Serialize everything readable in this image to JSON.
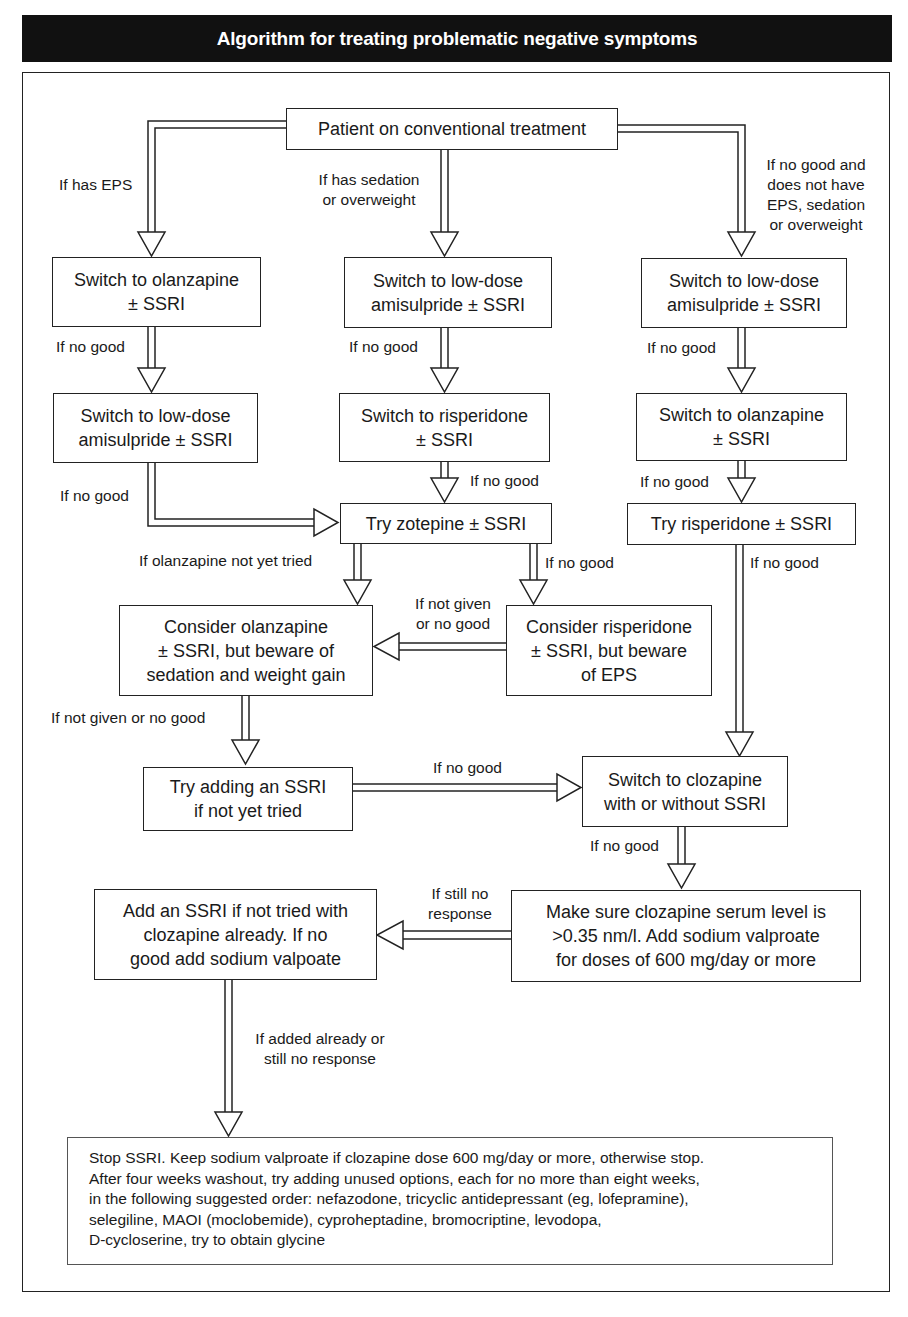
{
  "title": "Algorithm for treating problematic negative symptoms",
  "boxes": {
    "start": "Patient on conventional treatment",
    "left1_line1": "Switch to olanzapine",
    "left1_line2": "± SSRI",
    "left2_line1": "Switch to low-dose",
    "left2_line2": "amisulpride ± SSRI",
    "mid1_line1": "Switch to low-dose",
    "mid1_line2": "amisulpride ± SSRI",
    "mid2_line1": "Switch to risperidone",
    "mid2_line2": "± SSRI",
    "right1_line1": "Switch to low-dose",
    "right1_line2": "amisulpride ± SSRI",
    "right2_line1": "Switch to olanzapine",
    "right2_line2": "± SSRI",
    "right3": "Try risperidone ± SSRI",
    "zotepine": "Try zotepine ± SSRI",
    "consider_olanzapine_line1": "Consider olanzapine",
    "consider_olanzapine_line2": "± SSRI, but  beware of",
    "consider_olanzapine_line3": "sedation and weight gain",
    "consider_risperidone_line1": "Consider risperidone",
    "consider_risperidone_line2": "± SSRI, but beware",
    "consider_risperidone_line3": "of EPS",
    "add_ssri_line1": "Try adding an SSRI",
    "add_ssri_line2": "if not yet tried",
    "clozapine_line1": "Switch to clozapine",
    "clozapine_line2": "with or without SSRI",
    "serum_line1": "Make sure clozapine serum level is",
    "serum_line2": ">0.35 nm/l. Add sodium valproate",
    "serum_line3": "for doses of 600 mg/day or more",
    "add_ssri_cloz_line1": "Add an SSRI if not tried with",
    "add_ssri_cloz_line2": "clozapine already. If no",
    "add_ssri_cloz_line3": "good add sodium valpoate",
    "final_lines": [
      "Stop SSRI. Keep sodium valproate if clozapine dose 600 mg/day or more, otherwise stop.",
      "After four weeks washout, try adding unused options, each for no more than eight weeks,",
      "in the following suggested order: nefazodone, tricyclic antidepressant (eg, lofepramine),",
      "selegiline, MAOI (moclobemide), cyproheptadine, bromocriptine, levodopa,",
      "D-cycloserine, try to obtain glycine"
    ]
  },
  "labels": {
    "has_eps": "If has EPS",
    "sedation_1": "If has sedation",
    "sedation_2": "or overweight",
    "no_eps_1": "If no good and",
    "no_eps_2": "does not have",
    "no_eps_3": "EPS, sedation",
    "no_eps_4": "or overweight",
    "left_no_good_1": "If no good",
    "left_no_good_2": "If no good",
    "mid_no_good_1": "If no good",
    "mid_no_good_2": "If no good",
    "right_no_good_1": "If no good",
    "right_no_good_2": "If no good",
    "right_no_good_3": "If no good",
    "olanzapine_not_tried": "If olanzapine not yet tried",
    "zotepine_no_good": "If no good",
    "not_given_1": "If not given",
    "not_given_2": "or no good",
    "not_given_or_no_good": "If not given or no good",
    "ssri_no_good": "If no good",
    "clozapine_no_good": "If no good",
    "still_no_1": "If still no",
    "still_no_2": "response",
    "added_already_1": "If added already or",
    "added_already_2": "still no response"
  }
}
